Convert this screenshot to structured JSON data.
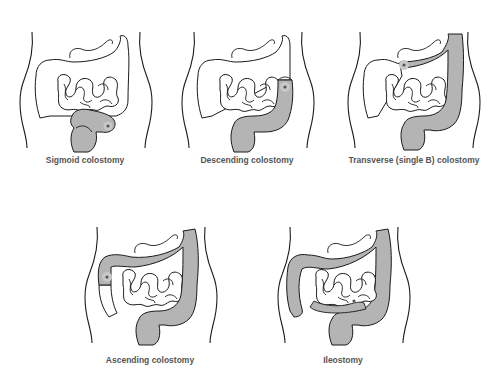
{
  "colors": {
    "outline": "#1a1a1a",
    "highlight_fill": "#b4b4b4",
    "stoma": "#555555",
    "caption": "#555555",
    "background": "#ffffff"
  },
  "panels": [
    {
      "id": "sigmoid",
      "label": "Sigmoid colostomy",
      "highlighted_segments": [
        "sigmoid",
        "rectum"
      ],
      "stoma_location": "sigmoid colon (lower left abdomen)"
    },
    {
      "id": "descending",
      "label": "Descending colostomy",
      "highlighted_segments": [
        "descending",
        "sigmoid",
        "rectum"
      ],
      "stoma_location": "descending colon (left abdomen)"
    },
    {
      "id": "transverse",
      "label": "Transverse (single B) colostomy",
      "highlighted_segments": [
        "transverse-left",
        "descending",
        "sigmoid",
        "rectum"
      ],
      "stoma_location": "transverse colon (upper abdomen)"
    },
    {
      "id": "ascending",
      "label": "Ascending colostomy",
      "highlighted_segments": [
        "ascending-upper",
        "transverse",
        "descending",
        "sigmoid",
        "rectum"
      ],
      "stoma_location": "ascending colon (right abdomen)"
    },
    {
      "id": "ileostomy",
      "label": "Ileostomy",
      "highlighted_segments": [
        "terminal-ileum",
        "ascending",
        "transverse",
        "descending",
        "sigmoid",
        "rectum"
      ],
      "stoma_location": "terminal ileum (lower right abdomen)"
    }
  ]
}
